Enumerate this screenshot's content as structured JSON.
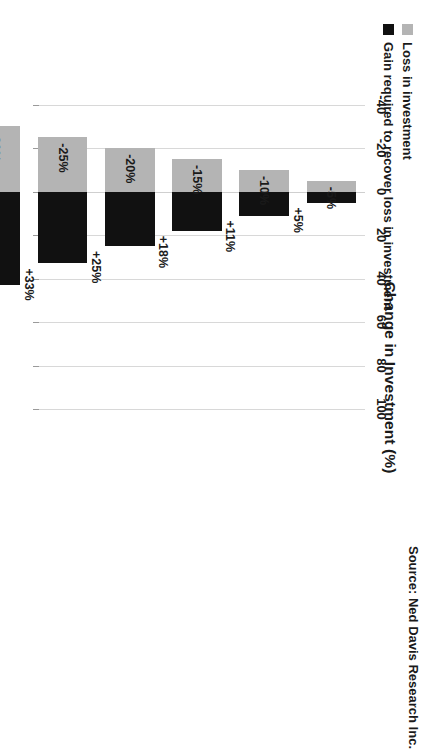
{
  "chart_data": {
    "type": "bar",
    "orientation": "horizontal-diverging-stacked",
    "title": "Change in Investment (%)",
    "xlabel": "Change in Investment (%)",
    "ylabel": "",
    "xlim": [
      -50,
      110
    ],
    "axis_ticks": [
      "-40",
      "-20",
      "0",
      "20",
      "40",
      "60",
      "80",
      "100"
    ],
    "axis_tick_values": [
      -40,
      -20,
      0,
      20,
      40,
      60,
      80,
      100
    ],
    "grid": true,
    "legend_position": "top-left",
    "series": [
      {
        "name": "Loss in investment",
        "color": "#b4b4b4",
        "values": [
          -5,
          -10,
          -15,
          -20,
          -25,
          -30,
          -35,
          -40,
          -45,
          -50
        ],
        "labels": [
          "-5%",
          "-10%",
          "-15%",
          "-20%",
          "-25%",
          "-30%",
          "-35%",
          "-40%",
          "-45%",
          "-50%"
        ]
      },
      {
        "name": "Gain required to recover loss in investment",
        "color": "#111111",
        "values": [
          5,
          11,
          18,
          25,
          33,
          43,
          54,
          67,
          82,
          100
        ],
        "labels": [
          "+5%",
          "+11%",
          "+18%",
          "+25%",
          "+33%",
          "+43%",
          "+54%",
          "+67%",
          "+82%",
          "+100%"
        ]
      }
    ],
    "categories": [
      "-5%",
      "-10%",
      "-15%",
      "-20%",
      "-25%",
      "-30%",
      "-35%",
      "-40%",
      "-45%",
      "-50%"
    ],
    "source": "Source: Ned Davis Research Inc."
  },
  "legend": {
    "items": [
      {
        "label": "Loss in investment",
        "color": "#b4b4b4",
        "swatch": "square-gray-swatch"
      },
      {
        "label": "Gain required to recover loss in investment",
        "color": "#111111",
        "swatch": "square-black-swatch"
      }
    ]
  },
  "footer": {
    "source_text": "Source: Ned Davis Research Inc."
  },
  "colors": {
    "loss": "#b4b4b4",
    "gain": "#111111",
    "grid": "#d8d8d8",
    "text": "#1a1a1a",
    "background": "#ffffff"
  }
}
